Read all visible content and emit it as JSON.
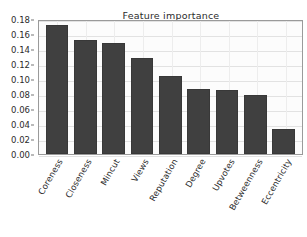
{
  "chart_data": {
    "type": "bar",
    "title": "Feature importance",
    "xlabel": "",
    "ylabel": "",
    "categories": [
      "Coreness",
      "Closeness",
      "Mincut",
      "Views",
      "Reputation",
      "Degree",
      "Upvotes",
      "Betweenness",
      "Eccentricity"
    ],
    "values": [
      0.172,
      0.152,
      0.148,
      0.128,
      0.104,
      0.087,
      0.086,
      0.079,
      0.034
    ],
    "ylim": [
      0.0,
      0.18
    ],
    "ytick_labels": [
      "0.00",
      "0.02",
      "0.04",
      "0.06",
      "0.08",
      "0.10",
      "0.12",
      "0.14",
      "0.16",
      "0.18"
    ],
    "ytick_values": [
      0.0,
      0.02,
      0.04,
      0.06,
      0.08,
      0.1,
      0.12,
      0.14,
      0.16,
      0.18
    ],
    "grid": true,
    "legend": false,
    "bar_color": "#404040",
    "plot_background": "#fcfcfc",
    "grid_color": "#e2e2e2",
    "text_color": "#2b2b2b",
    "xtick_rotation": -60
  }
}
